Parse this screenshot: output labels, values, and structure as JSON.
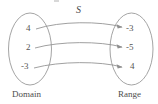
{
  "figure": {
    "relation_label": "S",
    "domain_label": "Domain",
    "range_label": "Range",
    "ink_color": "#8f8f8f",
    "text_color": "#4a4a4a",
    "background": "#ffffff"
  },
  "domain": {
    "values": [
      "4",
      "2",
      "-3"
    ]
  },
  "range": {
    "values": [
      "-3",
      "-5",
      "4"
    ]
  },
  "mappings": [
    {
      "from": "4",
      "to": "-3"
    },
    {
      "from": "2",
      "to": "-5"
    },
    {
      "from": "-3",
      "to": "4"
    }
  ]
}
